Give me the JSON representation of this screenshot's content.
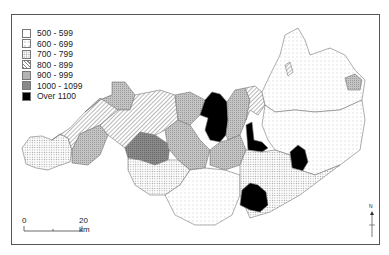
{
  "map": {
    "legend": {
      "items": [
        {
          "label": "500 - 599",
          "pattern": "blank",
          "color": "#ffffff"
        },
        {
          "label": "600 - 699",
          "pattern": "sparse-dots",
          "color": "#f2f2f2"
        },
        {
          "label": "700 - 799",
          "pattern": "dense-dots",
          "color": "#dcdcdc"
        },
        {
          "label": "800 - 899",
          "pattern": "diagonal-hatch",
          "color": "#cfcfcf"
        },
        {
          "label": "900 - 999",
          "pattern": "crosshatch",
          "color": "#b4b4b4"
        },
        {
          "label": "1000 - 1099",
          "pattern": "dark-crosshatch",
          "color": "#8f8f8f"
        },
        {
          "label": "Over 1100",
          "pattern": "solid",
          "color": "#000000"
        }
      ]
    },
    "scale_bar": {
      "start_label": "0",
      "end_label": "20 km"
    },
    "north_arrow": {
      "label": "N"
    }
  }
}
